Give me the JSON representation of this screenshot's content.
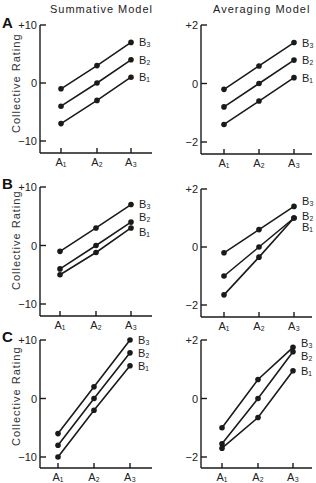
{
  "figure": {
    "column_titles": [
      "Summative Model",
      "Averaging Model"
    ],
    "panel_letters": [
      "A",
      "B",
      "C"
    ],
    "ylabel": "Collective Rating",
    "x_categories": [
      "A1",
      "A2",
      "A3"
    ],
    "series_labels": [
      "B3",
      "B2",
      "B1"
    ]
  },
  "chart_data": [
    {
      "type": "line",
      "panel": "A",
      "model": "Summative Model",
      "title": "Summative Model",
      "xlabel": "",
      "ylabel": "Collective Rating",
      "categories": [
        "A1",
        "A2",
        "A3"
      ],
      "ylim": [
        -10,
        10
      ],
      "yticks": [
        "+10",
        "0",
        "-10"
      ],
      "grid": false,
      "series": [
        {
          "name": "B3",
          "values": [
            -1,
            3,
            7
          ]
        },
        {
          "name": "B2",
          "values": [
            -4,
            0,
            4
          ]
        },
        {
          "name": "B1",
          "values": [
            -7,
            -3,
            1
          ]
        }
      ]
    },
    {
      "type": "line",
      "panel": "A",
      "model": "Averaging Model",
      "title": "Averaging Model",
      "xlabel": "",
      "ylabel": "",
      "categories": [
        "A1",
        "A2",
        "A3"
      ],
      "ylim": [
        -2,
        2
      ],
      "yticks": [
        "+2",
        "0",
        "-2"
      ],
      "grid": false,
      "series": [
        {
          "name": "B3",
          "values": [
            -0.2,
            0.6,
            1.4
          ]
        },
        {
          "name": "B2",
          "values": [
            -0.8,
            0,
            0.8
          ]
        },
        {
          "name": "B1",
          "values": [
            -1.4,
            -0.6,
            0.2
          ]
        }
      ]
    },
    {
      "type": "line",
      "panel": "B",
      "model": "Summative Model",
      "title": "",
      "xlabel": "",
      "ylabel": "Collective Rating",
      "categories": [
        "A1",
        "A2",
        "A3"
      ],
      "ylim": [
        -10,
        10
      ],
      "yticks": [
        "+10",
        "0",
        "-10"
      ],
      "grid": false,
      "series": [
        {
          "name": "B3",
          "values": [
            -1,
            3,
            7
          ]
        },
        {
          "name": "B2",
          "values": [
            -4,
            0,
            4
          ]
        },
        {
          "name": "B1",
          "values": [
            -5,
            -1.2,
            3
          ]
        }
      ]
    },
    {
      "type": "line",
      "panel": "B",
      "model": "Averaging Model",
      "title": "",
      "xlabel": "",
      "ylabel": "",
      "categories": [
        "A1",
        "A2",
        "A3"
      ],
      "ylim": [
        -2,
        2
      ],
      "yticks": [
        "+2",
        "0",
        "-2"
      ],
      "grid": false,
      "series": [
        {
          "name": "B3",
          "values": [
            -0.2,
            0.6,
            1.4
          ]
        },
        {
          "name": "B2",
          "values": [
            -1.0,
            0,
            1.0
          ]
        },
        {
          "name": "B1",
          "values": [
            -1.65,
            -0.35,
            1.0
          ]
        }
      ]
    },
    {
      "type": "line",
      "panel": "C",
      "model": "Summative Model",
      "title": "",
      "xlabel": "",
      "ylabel": "Collective Rating",
      "categories": [
        "A1",
        "A2",
        "A3"
      ],
      "ylim": [
        -10,
        10
      ],
      "yticks": [
        "+10",
        "0",
        "-10"
      ],
      "grid": false,
      "series": [
        {
          "name": "B3",
          "values": [
            -6,
            2,
            10
          ]
        },
        {
          "name": "B2",
          "values": [
            -8,
            0,
            7.8
          ]
        },
        {
          "name": "B1",
          "values": [
            -10,
            -2,
            5.6
          ]
        }
      ]
    },
    {
      "type": "line",
      "panel": "C",
      "model": "Averaging Model",
      "title": "",
      "xlabel": "",
      "ylabel": "",
      "categories": [
        "A1",
        "A2",
        "A3"
      ],
      "ylim": [
        -2,
        2
      ],
      "yticks": [
        "+2",
        "0",
        "-2"
      ],
      "grid": false,
      "series": [
        {
          "name": "B3",
          "values": [
            -1.0,
            0.65,
            1.75
          ]
        },
        {
          "name": "B2",
          "values": [
            -1.55,
            0,
            1.6
          ]
        },
        {
          "name": "B1",
          "values": [
            -1.7,
            -0.65,
            0.95
          ]
        }
      ]
    }
  ]
}
